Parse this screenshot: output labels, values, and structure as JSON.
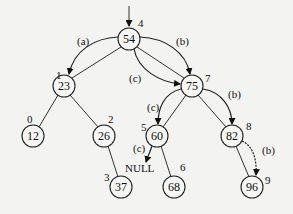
{
  "diagram": {
    "type": "binary-search-tree",
    "nodes": [
      {
        "id": "n54",
        "value": "54",
        "index": "4",
        "x": 129,
        "y": 39
      },
      {
        "id": "n23",
        "value": "23",
        "index": "1",
        "x": 64,
        "y": 86
      },
      {
        "id": "n75",
        "value": "75",
        "index": "7",
        "x": 192,
        "y": 86
      },
      {
        "id": "n12",
        "value": "12",
        "index": "0",
        "x": 33,
        "y": 136
      },
      {
        "id": "n26",
        "value": "26",
        "index": "2",
        "x": 104,
        "y": 136
      },
      {
        "id": "n60",
        "value": "60",
        "index": "5",
        "x": 157,
        "y": 136
      },
      {
        "id": "n82",
        "value": "82",
        "index": "8",
        "x": 232,
        "y": 136
      },
      {
        "id": "n37",
        "value": "37",
        "index": "3",
        "x": 121,
        "y": 187
      },
      {
        "id": "n68",
        "value": "68",
        "index": "6",
        "x": 174,
        "y": 187
      },
      {
        "id": "n96",
        "value": "96",
        "index": "9",
        "x": 252,
        "y": 187
      }
    ],
    "edges": [
      [
        "54",
        "23"
      ],
      [
        "54",
        "75"
      ],
      [
        "23",
        "12"
      ],
      [
        "23",
        "26"
      ],
      [
        "26",
        "37"
      ],
      [
        "75",
        "60"
      ],
      [
        "75",
        "82"
      ],
      [
        "60",
        "68"
      ],
      [
        "82",
        "96"
      ]
    ],
    "search_paths": [
      {
        "label": "(a)",
        "path": [
          "54",
          "23"
        ]
      },
      {
        "label": "(b)",
        "path": [
          "54",
          "75",
          "82",
          "96"
        ]
      },
      {
        "label": "(c)",
        "path": [
          "54",
          "75",
          "60",
          "NULL"
        ]
      }
    ],
    "labels": {
      "a": "(a)",
      "b": "(b)",
      "c": "(c)",
      "null": "NULL"
    }
  }
}
